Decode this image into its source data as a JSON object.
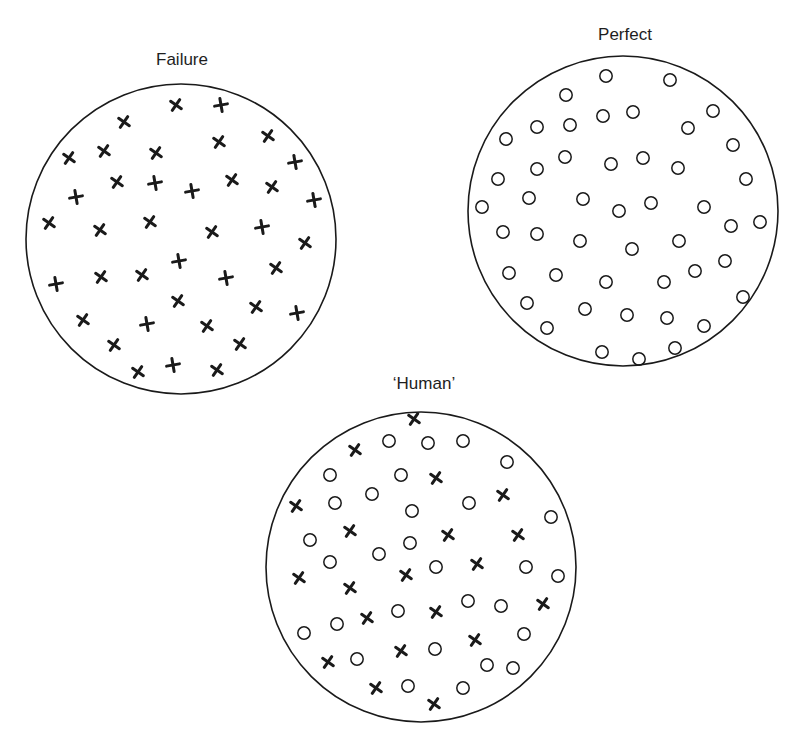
{
  "figure": {
    "diagrams": [
      {
        "id": "failure",
        "title": "Failure",
        "title_pos": [
          182,
          55
        ],
        "circle": {
          "cx": 181,
          "cy": 239,
          "r": 155
        },
        "markers": [
          {
            "type": "x",
            "x": 176,
            "y": 105
          },
          {
            "type": "plus",
            "x": 221,
            "y": 105
          },
          {
            "type": "x",
            "x": 124,
            "y": 122
          },
          {
            "type": "x",
            "x": 219,
            "y": 142
          },
          {
            "type": "x",
            "x": 268,
            "y": 136
          },
          {
            "type": "x",
            "x": 69,
            "y": 158
          },
          {
            "type": "x",
            "x": 104,
            "y": 151
          },
          {
            "type": "x",
            "x": 156,
            "y": 153
          },
          {
            "type": "plus",
            "x": 295,
            "y": 162
          },
          {
            "type": "x",
            "x": 117,
            "y": 182
          },
          {
            "type": "plus",
            "x": 155,
            "y": 183
          },
          {
            "type": "plus",
            "x": 192,
            "y": 191
          },
          {
            "type": "x",
            "x": 232,
            "y": 180
          },
          {
            "type": "x",
            "x": 272,
            "y": 187
          },
          {
            "type": "plus",
            "x": 76,
            "y": 197
          },
          {
            "type": "plus",
            "x": 314,
            "y": 200
          },
          {
            "type": "x",
            "x": 49,
            "y": 223
          },
          {
            "type": "x",
            "x": 100,
            "y": 230
          },
          {
            "type": "x",
            "x": 150,
            "y": 222
          },
          {
            "type": "x",
            "x": 212,
            "y": 232
          },
          {
            "type": "plus",
            "x": 262,
            "y": 227
          },
          {
            "type": "x",
            "x": 305,
            "y": 243
          },
          {
            "type": "plus",
            "x": 179,
            "y": 261
          },
          {
            "type": "x",
            "x": 276,
            "y": 268
          },
          {
            "type": "plus",
            "x": 56,
            "y": 284
          },
          {
            "type": "x",
            "x": 101,
            "y": 277
          },
          {
            "type": "x",
            "x": 142,
            "y": 275
          },
          {
            "type": "plus",
            "x": 226,
            "y": 278
          },
          {
            "type": "x",
            "x": 178,
            "y": 301
          },
          {
            "type": "x",
            "x": 256,
            "y": 307
          },
          {
            "type": "plus",
            "x": 297,
            "y": 313
          },
          {
            "type": "x",
            "x": 83,
            "y": 320
          },
          {
            "type": "plus",
            "x": 147,
            "y": 324
          },
          {
            "type": "x",
            "x": 207,
            "y": 326
          },
          {
            "type": "x",
            "x": 114,
            "y": 345
          },
          {
            "type": "x",
            "x": 240,
            "y": 344
          },
          {
            "type": "x",
            "x": 138,
            "y": 372
          },
          {
            "type": "plus",
            "x": 173,
            "y": 365
          },
          {
            "type": "x",
            "x": 217,
            "y": 370
          }
        ]
      },
      {
        "id": "perfect",
        "title": "Perfect",
        "title_pos": [
          625,
          30
        ],
        "circle": {
          "cx": 623,
          "cy": 211,
          "r": 155
        },
        "markers": [
          {
            "type": "o",
            "x": 606,
            "y": 76
          },
          {
            "type": "o",
            "x": 670,
            "y": 80
          },
          {
            "type": "o",
            "x": 566,
            "y": 95
          },
          {
            "type": "o",
            "x": 603,
            "y": 116
          },
          {
            "type": "o",
            "x": 633,
            "y": 112
          },
          {
            "type": "o",
            "x": 713,
            "y": 111
          },
          {
            "type": "o",
            "x": 537,
            "y": 127
          },
          {
            "type": "o",
            "x": 570,
            "y": 125
          },
          {
            "type": "o",
            "x": 688,
            "y": 128
          },
          {
            "type": "o",
            "x": 506,
            "y": 139
          },
          {
            "type": "o",
            "x": 733,
            "y": 145
          },
          {
            "type": "o",
            "x": 565,
            "y": 157
          },
          {
            "type": "o",
            "x": 611,
            "y": 164
          },
          {
            "type": "o",
            "x": 643,
            "y": 158
          },
          {
            "type": "o",
            "x": 678,
            "y": 168
          },
          {
            "type": "o",
            "x": 537,
            "y": 169
          },
          {
            "type": "o",
            "x": 498,
            "y": 179
          },
          {
            "type": "o",
            "x": 746,
            "y": 179
          },
          {
            "type": "o",
            "x": 529,
            "y": 198
          },
          {
            "type": "o",
            "x": 583,
            "y": 199
          },
          {
            "type": "o",
            "x": 482,
            "y": 207
          },
          {
            "type": "o",
            "x": 619,
            "y": 211
          },
          {
            "type": "o",
            "x": 651,
            "y": 203
          },
          {
            "type": "o",
            "x": 704,
            "y": 207
          },
          {
            "type": "o",
            "x": 731,
            "y": 226
          },
          {
            "type": "o",
            "x": 760,
            "y": 222
          },
          {
            "type": "o",
            "x": 503,
            "y": 232
          },
          {
            "type": "o",
            "x": 537,
            "y": 234
          },
          {
            "type": "o",
            "x": 580,
            "y": 241
          },
          {
            "type": "o",
            "x": 679,
            "y": 241
          },
          {
            "type": "o",
            "x": 632,
            "y": 249
          },
          {
            "type": "o",
            "x": 725,
            "y": 261
          },
          {
            "type": "o",
            "x": 695,
            "y": 271
          },
          {
            "type": "o",
            "x": 509,
            "y": 273
          },
          {
            "type": "o",
            "x": 556,
            "y": 275
          },
          {
            "type": "o",
            "x": 606,
            "y": 282
          },
          {
            "type": "o",
            "x": 664,
            "y": 282
          },
          {
            "type": "o",
            "x": 743,
            "y": 297
          },
          {
            "type": "o",
            "x": 527,
            "y": 303
          },
          {
            "type": "o",
            "x": 585,
            "y": 309
          },
          {
            "type": "o",
            "x": 627,
            "y": 315
          },
          {
            "type": "o",
            "x": 667,
            "y": 318
          },
          {
            "type": "o",
            "x": 704,
            "y": 326
          },
          {
            "type": "o",
            "x": 547,
            "y": 328
          },
          {
            "type": "o",
            "x": 602,
            "y": 352
          },
          {
            "type": "o",
            "x": 639,
            "y": 359
          },
          {
            "type": "o",
            "x": 675,
            "y": 348
          }
        ]
      },
      {
        "id": "human",
        "title": "‘Human’",
        "title_pos": [
          424,
          379
        ],
        "circle": {
          "cx": 421,
          "cy": 567,
          "r": 155
        },
        "markers": [
          {
            "type": "x",
            "x": 414,
            "y": 419
          },
          {
            "type": "x",
            "x": 355,
            "y": 450
          },
          {
            "type": "o",
            "x": 389,
            "y": 441
          },
          {
            "type": "o",
            "x": 428,
            "y": 443
          },
          {
            "type": "o",
            "x": 463,
            "y": 441
          },
          {
            "type": "o",
            "x": 507,
            "y": 462
          },
          {
            "type": "o",
            "x": 330,
            "y": 475
          },
          {
            "type": "o",
            "x": 401,
            "y": 475
          },
          {
            "type": "x",
            "x": 436,
            "y": 478
          },
          {
            "type": "x",
            "x": 503,
            "y": 495
          },
          {
            "type": "o",
            "x": 372,
            "y": 494
          },
          {
            "type": "x",
            "x": 296,
            "y": 506
          },
          {
            "type": "o",
            "x": 335,
            "y": 503
          },
          {
            "type": "o",
            "x": 412,
            "y": 511
          },
          {
            "type": "o",
            "x": 469,
            "y": 503
          },
          {
            "type": "o",
            "x": 551,
            "y": 517
          },
          {
            "type": "x",
            "x": 350,
            "y": 531
          },
          {
            "type": "x",
            "x": 448,
            "y": 535
          },
          {
            "type": "x",
            "x": 518,
            "y": 535
          },
          {
            "type": "o",
            "x": 310,
            "y": 540
          },
          {
            "type": "o",
            "x": 410,
            "y": 543
          },
          {
            "type": "o",
            "x": 379,
            "y": 554
          },
          {
            "type": "o",
            "x": 330,
            "y": 562
          },
          {
            "type": "x",
            "x": 477,
            "y": 564
          },
          {
            "type": "o",
            "x": 436,
            "y": 567
          },
          {
            "type": "o",
            "x": 526,
            "y": 567
          },
          {
            "type": "x",
            "x": 299,
            "y": 578
          },
          {
            "type": "x",
            "x": 406,
            "y": 575
          },
          {
            "type": "o",
            "x": 558,
            "y": 576
          },
          {
            "type": "x",
            "x": 350,
            "y": 588
          },
          {
            "type": "o",
            "x": 468,
            "y": 601
          },
          {
            "type": "o",
            "x": 501,
            "y": 606
          },
          {
            "type": "x",
            "x": 543,
            "y": 604
          },
          {
            "type": "o",
            "x": 398,
            "y": 611
          },
          {
            "type": "x",
            "x": 436,
            "y": 612
          },
          {
            "type": "o",
            "x": 337,
            "y": 624
          },
          {
            "type": "x",
            "x": 367,
            "y": 618
          },
          {
            "type": "o",
            "x": 304,
            "y": 633
          },
          {
            "type": "x",
            "x": 475,
            "y": 640
          },
          {
            "type": "o",
            "x": 524,
            "y": 634
          },
          {
            "type": "x",
            "x": 401,
            "y": 651
          },
          {
            "type": "o",
            "x": 435,
            "y": 649
          },
          {
            "type": "x",
            "x": 328,
            "y": 662
          },
          {
            "type": "o",
            "x": 357,
            "y": 659
          },
          {
            "type": "o",
            "x": 487,
            "y": 665
          },
          {
            "type": "o",
            "x": 513,
            "y": 668
          },
          {
            "type": "x",
            "x": 376,
            "y": 688
          },
          {
            "type": "o",
            "x": 408,
            "y": 686
          },
          {
            "type": "o",
            "x": 463,
            "y": 688
          },
          {
            "type": "x",
            "x": 434,
            "y": 704
          }
        ]
      }
    ]
  }
}
